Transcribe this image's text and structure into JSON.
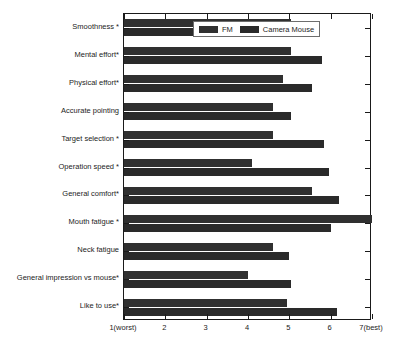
{
  "chart_data": {
    "type": "bar",
    "orientation": "horizontal",
    "title": "",
    "xlabel": "",
    "ylabel": "",
    "xlim": [
      1,
      7
    ],
    "xticks": [
      1,
      2,
      3,
      4,
      5,
      6,
      7
    ],
    "xticklabels": [
      "1(worst)",
      "2",
      "3",
      "4",
      "5",
      "6",
      "7(best)"
    ],
    "grid": false,
    "legend_position": "upper center",
    "categories": [
      "Smoothness *",
      "Mental effort*",
      "Physical effort*",
      "Accurate pointing",
      "Target selection *",
      "Operation speed *",
      "General comfort*",
      "Mouth fatigue *",
      "Neck fatigue",
      "General impression vs mouse*",
      "Like to use*"
    ],
    "series": [
      {
        "name": "FM",
        "color": "#303030",
        "values": [
          5.05,
          5.05,
          4.85,
          4.6,
          4.6,
          4.1,
          5.55,
          7.0,
          4.6,
          4.0,
          4.95
        ]
      },
      {
        "name": "Camera Mouse",
        "color": "#2a2a2a",
        "values": [
          5.7,
          5.8,
          5.55,
          5.05,
          5.85,
          5.95,
          6.2,
          6.0,
          5.0,
          5.05,
          6.15
        ]
      }
    ]
  },
  "legend": {
    "entries": [
      {
        "label": "FM"
      },
      {
        "label": "Camera Mouse"
      }
    ]
  },
  "axis": {
    "tick_labels": [
      "1(worst)",
      "2",
      "3",
      "4",
      "5",
      "6",
      "7(best)"
    ]
  }
}
